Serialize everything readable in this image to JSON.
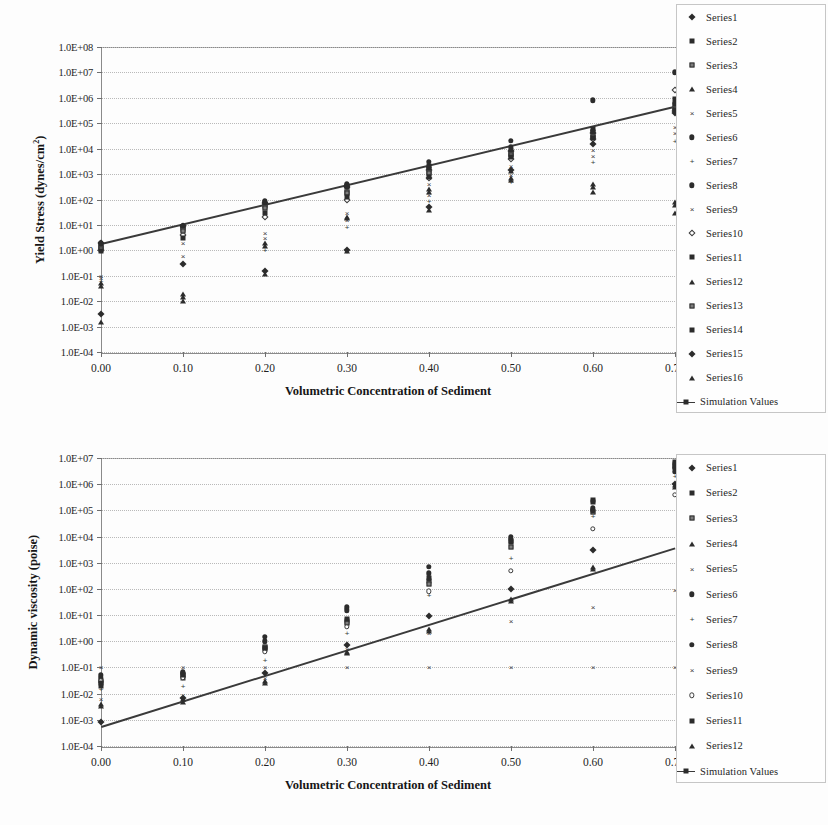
{
  "page": {
    "background": "#fdfdfd",
    "ink": "#2b2b2b"
  },
  "chart_data": [
    {
      "id": "yield-stress-chart",
      "type": "scatter",
      "title": "",
      "xlabel": "Volumetric Concentration of Sediment",
      "ylabel": "Yield Stress (dynes/cm",
      "ylabel_sup": "2",
      "ylabel_tail": ")",
      "yscale": "log",
      "xlim": [
        0.0,
        0.7
      ],
      "ylim": [
        0.0001,
        100000000
      ],
      "grid": true,
      "legend_position": "right",
      "xticks": [
        "0.00",
        "0.10",
        "0.20",
        "0.30",
        "0.40",
        "0.50",
        "0.60",
        "0.70"
      ],
      "xtick_values": [
        0.0,
        0.1,
        0.2,
        0.3,
        0.4,
        0.5,
        0.6,
        0.7
      ],
      "yticks": [
        "1.0E+08",
        "1.0E+07",
        "1.0E+06",
        "1.0E+05",
        "1.0E+04",
        "1.0E+03",
        "1.0E+02",
        "1.0E+01",
        "1.0E+00",
        "1.0E-01",
        "1.0E-02",
        "1.0E-03",
        "1.0E-04"
      ],
      "ytick_values": [
        100000000,
        10000000,
        1000000,
        100000,
        10000,
        1000,
        100,
        10,
        1,
        0.1,
        0.01,
        0.001,
        0.0001
      ],
      "trendline": {
        "name": "Simulation Values",
        "x": [
          0.0,
          0.7
        ],
        "y": [
          2.0,
          500000.0
        ]
      },
      "series": [
        {
          "name": "Series1",
          "marker": "diamond",
          "x": [
            0.0,
            0.1,
            0.2,
            0.3,
            0.4,
            0.5,
            0.6,
            0.7
          ],
          "y": [
            2.0,
            9.0,
            70.0,
            300.0,
            1500.0,
            8000.0,
            40000.0,
            300000.0
          ]
        },
        {
          "name": "Series2",
          "marker": "square",
          "x": [
            0.0,
            0.1,
            0.2,
            0.3,
            0.4,
            0.5,
            0.6,
            0.7
          ],
          "y": [
            1.5,
            8.0,
            60.0,
            320.0,
            2000.0,
            9000.0,
            60000.0,
            900000.0
          ]
        },
        {
          "name": "Series3",
          "marker": "sq-open",
          "x": [
            0.0,
            0.1,
            0.2,
            0.3,
            0.4,
            0.5,
            0.6,
            0.7
          ],
          "y": [
            1.2,
            7.0,
            55.0,
            200.0,
            1200.0,
            6000.0,
            30000.0,
            400000.0
          ]
        },
        {
          "name": "Series4",
          "marker": "triangle",
          "x": [
            0.0,
            0.1,
            0.2,
            0.3,
            0.4,
            0.5,
            0.6,
            0.7
          ],
          "y": [
            0.05,
            0.02,
            2.0,
            20.0,
            200.0,
            600.0,
            300.0,
            60.0
          ]
        },
        {
          "name": "Series5",
          "marker": "x",
          "x": [
            0.0,
            0.1,
            0.2,
            0.3,
            0.4,
            0.5,
            0.6,
            0.7
          ],
          "y": [
            0.1,
            2.0,
            5.0,
            30.0,
            400.0,
            2000.0,
            9000.0,
            70000.0
          ]
        },
        {
          "name": "Series6",
          "marker": "circle",
          "x": [
            0.0,
            0.1,
            0.2,
            0.3,
            0.4,
            0.5,
            0.6,
            0.7
          ],
          "y": [
            2.0,
            9.0,
            80.0,
            400.0,
            3000.0,
            20000.0,
            800000.0,
            10000000.0
          ]
        },
        {
          "name": "Series7",
          "marker": "plus",
          "x": [
            0.0,
            0.1,
            0.2,
            0.3,
            0.4,
            0.5,
            0.6,
            0.7
          ],
          "y": [
            0.06,
            0.3,
            1.0,
            8.0,
            90.0,
            500.0,
            3000.0,
            20000.0
          ]
        },
        {
          "name": "Series8",
          "marker": "circle",
          "x": [
            0.0,
            0.1,
            0.2,
            0.3,
            0.4,
            0.5,
            0.6,
            0.7
          ],
          "y": [
            1.8,
            9.0,
            90.0,
            350.0,
            1800.0,
            12000.0,
            50000.0,
            600000.0
          ]
        },
        {
          "name": "Series9",
          "marker": "x",
          "x": [
            0.0,
            0.1,
            0.2,
            0.3,
            0.4,
            0.5,
            0.6,
            0.7
          ],
          "y": [
            0.08,
            0.6,
            3.0,
            15.0,
            150.0,
            900.0,
            5000.0,
            40000.0
          ]
        },
        {
          "name": "Series10",
          "marker": "diamond-open",
          "x": [
            0.0,
            0.1,
            0.2,
            0.3,
            0.4,
            0.5,
            0.6,
            0.7
          ],
          "y": [
            1.0,
            4.0,
            20.0,
            100.0,
            700.0,
            4000.0,
            25000.0,
            2000000.0
          ]
        },
        {
          "name": "Series11",
          "marker": "square",
          "x": [
            0.0,
            0.1,
            0.2,
            0.3,
            0.4,
            0.5,
            0.6,
            0.7
          ],
          "y": [
            1.4,
            8.5,
            65.0,
            330.0,
            1600.0,
            7000.0,
            45000.0,
            500000.0
          ]
        },
        {
          "name": "Series12",
          "marker": "triangle",
          "x": [
            0.0,
            0.1,
            0.2,
            0.3,
            0.4,
            0.5,
            0.6,
            0.7
          ],
          "y": [
            0.04,
            0.015,
            1.5,
            18.0,
            250.0,
            700.0,
            400.0,
            80.0
          ]
        },
        {
          "name": "Series13",
          "marker": "sq-open",
          "x": [
            0.0,
            0.1,
            0.2,
            0.3,
            0.4,
            0.5,
            0.6,
            0.7
          ],
          "y": [
            1.1,
            6.0,
            45.0,
            180.0,
            1100.0,
            5500.0,
            28000.0,
            350000.0
          ]
        },
        {
          "name": "Series14",
          "marker": "square",
          "x": [
            0.0,
            0.1,
            0.2,
            0.3,
            0.4,
            0.5,
            0.6,
            0.7
          ],
          "y": [
            0.9,
            3.0,
            30.0,
            120.0,
            800.0,
            4500.0,
            26000.0,
            320000.0
          ]
        },
        {
          "name": "Series15",
          "marker": "diamond",
          "x": [
            0.0,
            0.1,
            0.2,
            0.3,
            0.4,
            0.5,
            0.6,
            0.7
          ],
          "y": [
            0.003,
            0.3,
            0.15,
            1.0,
            50.0,
            1500.0,
            15000.0,
            250000.0
          ]
        },
        {
          "name": "Series16",
          "marker": "triangle",
          "x": [
            0.0,
            0.1,
            0.2,
            0.3,
            0.4,
            0.5,
            0.6,
            0.7
          ],
          "y": [
            0.0015,
            0.01,
            0.12,
            0.9,
            40.0,
            1300.0,
            200.0,
            30.0
          ]
        }
      ]
    },
    {
      "id": "dynamic-viscosity-chart",
      "type": "scatter",
      "title": "",
      "xlabel": "Volumetric Concentration of Sediment",
      "ylabel": "Dynamic viscosity (poise)",
      "ylabel_sup": "",
      "ylabel_tail": "",
      "yscale": "log",
      "xlim": [
        0.0,
        0.7
      ],
      "ylim": [
        0.0001,
        10000000
      ],
      "grid": true,
      "legend_position": "right",
      "xticks": [
        "0.00",
        "0.10",
        "0.20",
        "0.30",
        "0.40",
        "0.50",
        "0.60",
        "0.70"
      ],
      "xtick_values": [
        0.0,
        0.1,
        0.2,
        0.3,
        0.4,
        0.5,
        0.6,
        0.7
      ],
      "yticks": [
        "1.0E+07",
        "1.0E+06",
        "1.0E+05",
        "1.0E+04",
        "1.0E+03",
        "1.0E+02",
        "1.0E+01",
        "1.0E+00",
        "1.0E-01",
        "1.0E-02",
        "1.0E-03",
        "1.0E-04"
      ],
      "ytick_values": [
        10000000,
        1000000,
        100000,
        10000,
        1000,
        100,
        10,
        1,
        0.1,
        0.01,
        0.001,
        0.0001
      ],
      "trendline": {
        "name": "Simulation Values",
        "x": [
          0.0,
          0.7
        ],
        "y": [
          0.0006,
          4000.0
        ]
      },
      "series": [
        {
          "name": "Series1",
          "marker": "diamond",
          "x": [
            0.0,
            0.1,
            0.2,
            0.3,
            0.4,
            0.5,
            0.6,
            0.7
          ],
          "y": [
            0.0008,
            0.007,
            0.06,
            0.7,
            9.0,
            100.0,
            3000.0,
            1000000.0
          ]
        },
        {
          "name": "Series2",
          "marker": "square",
          "x": [
            0.0,
            0.1,
            0.2,
            0.3,
            0.4,
            0.5,
            0.6,
            0.7
          ],
          "y": [
            0.02,
            0.04,
            0.5,
            6.0,
            200.0,
            7000.0,
            250000.0,
            7000000.0
          ]
        },
        {
          "name": "Series3",
          "marker": "sq-open",
          "x": [
            0.0,
            0.1,
            0.2,
            0.3,
            0.4,
            0.5,
            0.6,
            0.7
          ],
          "y": [
            0.03,
            0.05,
            0.6,
            5.0,
            150.0,
            4000.0,
            90000.0,
            5000000.0
          ]
        },
        {
          "name": "Series4",
          "marker": "triangle",
          "x": [
            0.0,
            0.1,
            0.2,
            0.3,
            0.4,
            0.5,
            0.6,
            0.7
          ],
          "y": [
            0.004,
            0.006,
            0.03,
            0.4,
            3.0,
            40.0,
            700.0,
            900000.0
          ]
        },
        {
          "name": "Series5",
          "marker": "x",
          "x": [
            0.0,
            0.1,
            0.2,
            0.3,
            0.4,
            0.5,
            0.6,
            0.7
          ],
          "y": [
            0.1,
            0.1,
            0.1,
            0.1,
            0.1,
            0.1,
            0.1,
            0.1
          ]
        },
        {
          "name": "Series6",
          "marker": "circle",
          "x": [
            0.0,
            0.1,
            0.2,
            0.3,
            0.4,
            0.5,
            0.6,
            0.7
          ],
          "y": [
            0.04,
            0.06,
            1.5,
            20.0,
            700.0,
            10000.0,
            120000.0,
            4000000.0
          ]
        },
        {
          "name": "Series7",
          "marker": "plus",
          "x": [
            0.0,
            0.1,
            0.2,
            0.3,
            0.4,
            0.5,
            0.6,
            0.7
          ],
          "y": [
            0.015,
            0.02,
            0.2,
            2.0,
            60.0,
            1500.0,
            60000.0,
            2000000.0
          ]
        },
        {
          "name": "Series8",
          "marker": "circle",
          "x": [
            0.0,
            0.1,
            0.2,
            0.3,
            0.4,
            0.5,
            0.6,
            0.7
          ],
          "y": [
            0.05,
            0.07,
            1.0,
            15.0,
            400.0,
            8000.0,
            100000.0,
            3000000.0
          ]
        },
        {
          "name": "Series9",
          "marker": "x",
          "x": [
            0.0,
            0.1,
            0.2,
            0.3,
            0.4,
            0.5,
            0.6,
            0.7
          ],
          "y": [
            0.006,
            0.009,
            0.04,
            0.5,
            2.0,
            6.0,
            20.0,
            90.0
          ]
        },
        {
          "name": "Series10",
          "marker": "circle-open",
          "x": [
            0.0,
            0.1,
            0.2,
            0.3,
            0.4,
            0.5,
            0.6,
            0.7
          ],
          "y": [
            0.03,
            0.04,
            0.4,
            3.5,
            80.0,
            500.0,
            20000.0,
            400000.0
          ]
        },
        {
          "name": "Series11",
          "marker": "square",
          "x": [
            0.0,
            0.1,
            0.2,
            0.3,
            0.4,
            0.5,
            0.6,
            0.7
          ],
          "y": [
            0.025,
            0.05,
            0.55,
            7.0,
            250.0,
            6000.0,
            200000.0,
            6000000.0
          ]
        },
        {
          "name": "Series12",
          "marker": "triangle",
          "x": [
            0.0,
            0.1,
            0.2,
            0.3,
            0.4,
            0.5,
            0.6,
            0.7
          ],
          "y": [
            0.0035,
            0.005,
            0.025,
            0.35,
            2.5,
            35.0,
            600.0,
            800000.0
          ]
        }
      ]
    }
  ]
}
